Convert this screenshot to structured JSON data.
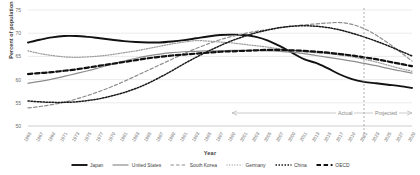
{
  "chart_data": {
    "type": "line",
    "title": "",
    "xlabel": "Year",
    "ylabel": "Percent of population",
    "ylim": [
      50,
      75
    ],
    "yticks": [
      50,
      55,
      60,
      65,
      70,
      75
    ],
    "grid": true,
    "xlim": [
      1965,
      2029
    ],
    "x": [
      1965,
      1967,
      1969,
      1971,
      1973,
      1975,
      1977,
      1979,
      1981,
      1983,
      1985,
      1987,
      1989,
      1991,
      1993,
      1995,
      1997,
      1999,
      2001,
      2003,
      2005,
      2007,
      2009,
      2011,
      2013,
      2015,
      2017,
      2019,
      2021,
      2023,
      2025,
      2027,
      2029
    ],
    "xticks": [
      "1965",
      "1967",
      "1969",
      "1971",
      "1973",
      "1975",
      "1977",
      "1979",
      "1981",
      "1983",
      "1985",
      "1987",
      "1989",
      "1991",
      "1993",
      "1995",
      "1997",
      "1999",
      "2001",
      "2003",
      "2005",
      "2007",
      "2009",
      "2011",
      "2013",
      "2015",
      "2017",
      "2019",
      "2021",
      "2023",
      "2025",
      "2027",
      "2029"
    ],
    "legend_position": "bottom",
    "annotations": [
      {
        "name": "actual-label",
        "text": "Actual"
      },
      {
        "name": "projected-label",
        "text": "Projected"
      },
      {
        "name": "divider-year",
        "value": 2021
      }
    ],
    "series": [
      {
        "name": "Japan",
        "style": "solid",
        "color": "#111111",
        "width": 1.9,
        "values": [
          68.0,
          68.6,
          69.1,
          69.4,
          69.4,
          69.2,
          68.9,
          68.6,
          68.3,
          68.1,
          68.0,
          68.0,
          68.2,
          68.5,
          68.9,
          69.3,
          69.6,
          69.7,
          69.6,
          69.2,
          68.4,
          67.2,
          65.8,
          64.4,
          63.6,
          62.4,
          61.1,
          60.1,
          59.5,
          59.2,
          58.9,
          58.6,
          58.2
        ]
      },
      {
        "name": "United States",
        "style": "solid",
        "color": "#8d8d8d",
        "width": 1.2,
        "values": [
          59.2,
          59.6,
          60.1,
          60.7,
          61.3,
          61.9,
          62.6,
          63.3,
          64.0,
          64.6,
          65.1,
          65.5,
          65.8,
          66.0,
          66.1,
          66.2,
          66.2,
          66.3,
          66.3,
          66.3,
          66.2,
          66.1,
          65.9,
          65.6,
          65.2,
          64.8,
          64.4,
          64.0,
          63.5,
          63.0,
          62.4,
          61.9,
          61.4
        ]
      },
      {
        "name": "South Korea",
        "style": "dashed",
        "color": "#8d8d8d",
        "width": 1.2,
        "values": [
          53.9,
          54.2,
          54.6,
          55.1,
          55.8,
          56.6,
          57.5,
          58.5,
          59.6,
          60.8,
          62.0,
          63.2,
          64.4,
          65.6,
          66.7,
          67.7,
          68.6,
          69.3,
          69.9,
          70.4,
          70.8,
          71.2,
          71.5,
          71.8,
          72.0,
          72.2,
          72.3,
          71.9,
          71.0,
          69.6,
          67.9,
          66.0,
          64.0
        ]
      },
      {
        "name": "Germany",
        "style": "dotted",
        "color": "#9a9a9a",
        "width": 1.2,
        "values": [
          66.2,
          65.6,
          65.2,
          64.9,
          64.8,
          64.9,
          65.1,
          65.4,
          65.8,
          66.2,
          66.7,
          67.2,
          67.7,
          68.1,
          68.4,
          68.3,
          68.1,
          67.9,
          67.6,
          67.3,
          67.0,
          66.6,
          66.3,
          66.0,
          65.8,
          65.6,
          65.3,
          64.9,
          64.4,
          63.8,
          63.1,
          62.4,
          61.8
        ]
      },
      {
        "name": "China",
        "style": "dotted",
        "color": "#1a1a1a",
        "width": 1.5,
        "values": [
          55.4,
          55.2,
          55.1,
          55.1,
          55.2,
          55.5,
          55.9,
          56.5,
          57.2,
          58.1,
          59.2,
          60.5,
          61.9,
          63.4,
          64.8,
          66.1,
          67.3,
          68.4,
          69.3,
          70.1,
          70.7,
          71.2,
          71.5,
          71.6,
          71.5,
          71.2,
          70.7,
          70.0,
          69.2,
          68.3,
          67.3,
          66.2,
          65.1
        ]
      },
      {
        "name": "OECD",
        "style": "dashed",
        "color": "#111111",
        "width": 2.2,
        "values": [
          61.2,
          61.4,
          61.6,
          61.9,
          62.2,
          62.6,
          63.0,
          63.4,
          63.8,
          64.2,
          64.6,
          64.9,
          65.2,
          65.4,
          65.6,
          65.8,
          66.0,
          66.1,
          66.2,
          66.3,
          66.4,
          66.4,
          66.3,
          66.2,
          66.0,
          65.8,
          65.5,
          65.2,
          64.8,
          64.4,
          63.9,
          63.4,
          62.9
        ]
      }
    ]
  }
}
